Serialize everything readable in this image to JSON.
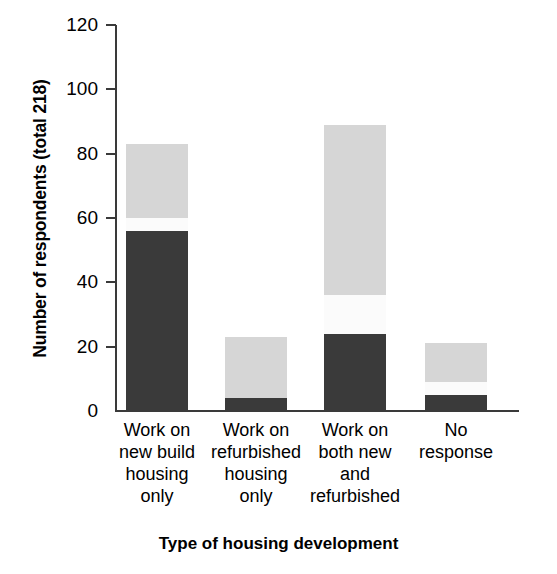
{
  "chart_data": {
    "type": "bar",
    "stacked": true,
    "title": "",
    "xlabel": "Type of housing development",
    "ylabel": "Number of respondents (total 218)",
    "categories": [
      "Work on\nnew build\nhousing\nonly",
      "Work on\nrefurbished\nhousing\nonly",
      "Work on\nboth new\nand\nrefurbished",
      "No\nresponse"
    ],
    "categories_flat": [
      "Work on new build housing only",
      "Work on refurbished housing only",
      "Work on both new and refurbished",
      "No response"
    ],
    "series": [
      {
        "name": "dark-segment",
        "color": "#3a3a3a",
        "values": [
          56,
          4,
          24,
          5
        ]
      },
      {
        "name": "white-segment",
        "color": "#fbfbfb",
        "values": [
          4,
          0,
          12,
          4
        ]
      },
      {
        "name": "light-segment",
        "color": "#d6d6d6",
        "values": [
          23,
          19,
          53,
          12
        ]
      }
    ],
    "totals": [
      83,
      23,
      89,
      21
    ],
    "ylim": [
      0,
      120
    ],
    "yticks": [
      0,
      20,
      40,
      60,
      80,
      100,
      120
    ],
    "ytick_labels": [
      "0",
      "20",
      "40",
      "60",
      "80",
      "100",
      "120"
    ],
    "grid": false,
    "legend": "none"
  },
  "axis": {
    "y_title": "Number of respondents (total 218)",
    "x_title": "Type of housing development"
  },
  "colors": {
    "dark": "#3a3a3a",
    "white": "#fbfbfb",
    "light": "#d6d6d6",
    "axis": "#3a3a3a",
    "background": "#ffffff"
  }
}
